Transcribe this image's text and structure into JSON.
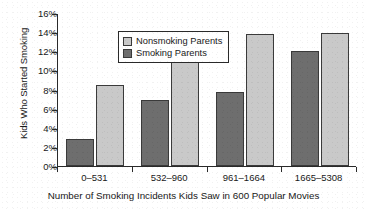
{
  "chart_data": {
    "type": "bar",
    "title": "",
    "xlabel": "Number of Smoking Incidents Kids Saw in 600 Popular Movies",
    "ylabel": "Kids Who Started Smoking",
    "categories": [
      "0–531",
      "532–960",
      "961–1664",
      "1665–5308"
    ],
    "series": [
      {
        "name": "Nonsmoking Parents",
        "color": "#c9c9c9",
        "values": [
          8.5,
          14.1,
          13.8,
          13.9
        ]
      },
      {
        "name": "Smoking Parents",
        "color": "#6e6e6e",
        "values": [
          2.8,
          6.9,
          7.7,
          12.0
        ]
      }
    ],
    "ylim": [
      0,
      16
    ],
    "ytick_labels": [
      "0%",
      "2%",
      "4%",
      "6%",
      "8%",
      "10%",
      "12%",
      "14%",
      "16%"
    ],
    "ytick_values": [
      0,
      2,
      4,
      6,
      8,
      10,
      12,
      14,
      16
    ],
    "yaxis_unit": "%",
    "grid": false,
    "legend_position": "top-left-inside",
    "bar_order_within_group": [
      "Smoking Parents",
      "Nonsmoking Parents"
    ]
  },
  "legend": {
    "items": [
      {
        "label": "Nonsmoking Parents",
        "swatch": "light"
      },
      {
        "label": "Smoking Parents",
        "swatch": "dark"
      }
    ]
  }
}
